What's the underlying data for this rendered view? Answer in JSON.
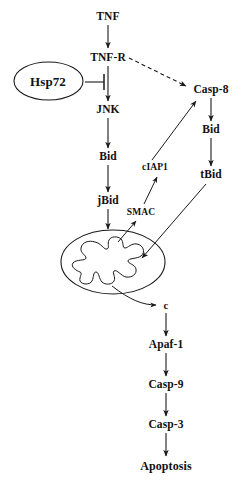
{
  "diagram": {
    "type": "biological-signaling-pathway",
    "width": 249,
    "height": 483,
    "background_color": "#ffffff",
    "stroke_color": "#1a1a1a",
    "text_color": "#111111"
  },
  "nodes": {
    "tnf": {
      "label": "TNF",
      "x": 108,
      "y": 17
    },
    "tnf_r": {
      "label": "TNF-R",
      "x": 108,
      "y": 58
    },
    "hsp72": {
      "label": "Hsp72",
      "x": 48,
      "y": 81
    },
    "jnk": {
      "label": "JNK",
      "x": 108,
      "y": 110
    },
    "bid_left": {
      "label": "Bid",
      "x": 108,
      "y": 157
    },
    "jbid": {
      "label": "jBid",
      "x": 108,
      "y": 201
    },
    "casp8": {
      "label": "Casp-8",
      "x": 211,
      "y": 90
    },
    "bid_right": {
      "label": "Bid",
      "x": 211,
      "y": 130
    },
    "tbid": {
      "label": "tBid",
      "x": 211,
      "y": 175
    },
    "ciap1": {
      "label": "cIAP1",
      "x": 155,
      "y": 168
    },
    "smac": {
      "label": "SMAC",
      "x": 141,
      "y": 213
    },
    "cytochrome_c": {
      "label": "c",
      "x": 166,
      "y": 306
    },
    "apaf1": {
      "label": "Apaf-1",
      "x": 166,
      "y": 345
    },
    "casp9": {
      "label": "Casp-9",
      "x": 166,
      "y": 385
    },
    "casp3": {
      "label": "Casp-3",
      "x": 166,
      "y": 425
    },
    "apoptosis": {
      "label": "Apoptosis",
      "x": 166,
      "y": 466
    }
  },
  "organelle": {
    "mitochondrion": {
      "name": "mitochondrion",
      "center_x": 113,
      "center_y": 262,
      "radius_x": 52,
      "radius_y": 32
    }
  },
  "edges": [
    {
      "name": "tnf-to-tnfr",
      "from": "TNF",
      "to": "TNF-R",
      "style": "solid",
      "head": "arrow"
    },
    {
      "name": "tnfr-to-jnk",
      "from": "TNF-R",
      "to": "JNK",
      "style": "solid",
      "head": "arrow"
    },
    {
      "name": "tnfr-to-casp8",
      "from": "TNF-R",
      "to": "Casp-8",
      "style": "dashed",
      "head": "arrow"
    },
    {
      "name": "hsp72-inhibits-tnfr-jnk",
      "from": "Hsp72",
      "to": "TNF-R to JNK",
      "style": "solid",
      "head": "bar"
    },
    {
      "name": "jnk-to-bid",
      "from": "JNK",
      "to": "Bid",
      "style": "solid",
      "head": "arrow"
    },
    {
      "name": "bid-to-jbid",
      "from": "Bid",
      "to": "jBid",
      "style": "solid",
      "head": "arrow"
    },
    {
      "name": "jbid-to-mitochondrion",
      "from": "jBid",
      "to": "mitochondrion",
      "style": "solid",
      "head": "arrow"
    },
    {
      "name": "casp8-to-bid",
      "from": "Casp-8",
      "to": "Bid",
      "style": "solid",
      "head": "arrow"
    },
    {
      "name": "bid-to-tbid",
      "from": "Bid",
      "to": "tBid",
      "style": "solid",
      "head": "arrow"
    },
    {
      "name": "tbid-to-mitochondrion",
      "from": "tBid",
      "to": "mitochondrion",
      "style": "solid",
      "head": "arrow"
    },
    {
      "name": "mitochondrion-to-smac",
      "from": "mitochondrion",
      "to": "SMAC",
      "style": "solid",
      "head": "arrow"
    },
    {
      "name": "smac-to-ciap1",
      "from": "SMAC",
      "to": "cIAP1",
      "style": "solid",
      "head": "arrow"
    },
    {
      "name": "ciap1-to-casp8",
      "from": "cIAP1",
      "to": "Casp-8",
      "style": "solid",
      "head": "arrow"
    },
    {
      "name": "mitochondrion-to-cytochrome-c",
      "from": "mitochondrion",
      "to": "c",
      "style": "solid",
      "head": "arrow"
    },
    {
      "name": "cytochrome-c-to-apaf1",
      "from": "c",
      "to": "Apaf-1",
      "style": "solid",
      "head": "arrow"
    },
    {
      "name": "apaf1-to-casp9",
      "from": "Apaf-1",
      "to": "Casp-9",
      "style": "solid",
      "head": "arrow"
    },
    {
      "name": "casp9-to-casp3",
      "from": "Casp-9",
      "to": "Casp-3",
      "style": "solid",
      "head": "arrow"
    },
    {
      "name": "casp3-to-apoptosis",
      "from": "Casp-3",
      "to": "Apoptosis",
      "style": "solid",
      "head": "arrow"
    }
  ]
}
